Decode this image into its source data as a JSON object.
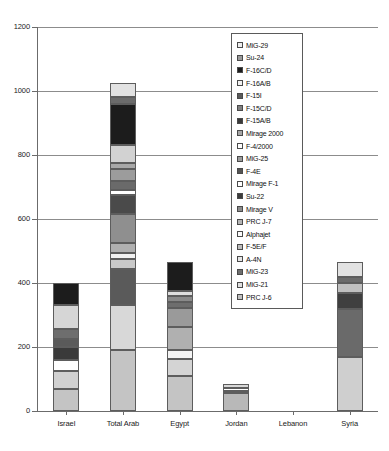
{
  "chart_data": {
    "type": "bar",
    "stacked": true,
    "title": "",
    "xlabel": "",
    "ylabel": "",
    "ylim": [
      0,
      1200
    ],
    "ytick_labels": [
      "0",
      "200",
      "400",
      "600",
      "800",
      "1000",
      "1200"
    ],
    "ytick_values": [
      0,
      200,
      400,
      600,
      800,
      1000,
      1200
    ],
    "grid": true,
    "legend_position": "inside-upper-right",
    "categories": [
      "Israel",
      "Total Arab",
      "Egypt",
      "Jordan",
      "Lebanon",
      "Syria"
    ],
    "totals": [
      400,
      1025,
      465,
      85,
      0,
      465
    ],
    "series": [
      {
        "name": "MiG-29",
        "color": "#e8e8e8",
        "values": [
          0,
          45,
          0,
          0,
          0,
          45
        ]
      },
      {
        "name": "Su-24",
        "color": "#6b6b6b",
        "values": [
          0,
          20,
          0,
          0,
          0,
          20
        ]
      },
      {
        "name": "F-16C/D",
        "color": "#1c1c1c",
        "values": [
          50,
          50,
          0,
          0,
          0,
          0
        ]
      },
      {
        "name": "F-16A/B",
        "color": "#d9d9d9",
        "values": [
          0,
          0,
          0,
          0,
          0,
          0
        ]
      },
      {
        "name": "F-15I",
        "color": "#4f4f4f",
        "values": [
          0,
          0,
          0,
          0,
          0,
          0
        ]
      },
      {
        "name": "F-15C/D",
        "color": "#6e6e6e",
        "values": [
          0,
          0,
          0,
          0,
          0,
          0
        ]
      },
      {
        "name": "F-15A/B",
        "color": "#3c3c3c",
        "values": [
          0,
          0,
          0,
          0,
          0,
          0
        ]
      },
      {
        "name": "Mirage 2000",
        "color": "#a8a8a8",
        "values": [
          0,
          110,
          0,
          0,
          0,
          0
        ]
      },
      {
        "name": "F-4/2000",
        "color": "#fbfbfb",
        "values": [
          0,
          0,
          0,
          0,
          0,
          0
        ]
      },
      {
        "name": "MiG-25",
        "color": "#9c9c9c",
        "values": [
          0,
          35,
          0,
          0,
          0,
          35
        ]
      },
      {
        "name": "F-4E",
        "color": "#575757",
        "values": [
          0,
          0,
          0,
          0,
          0,
          0
        ]
      },
      {
        "name": "Mirage F-1",
        "color": "#ffffff",
        "values": [
          0,
          15,
          0,
          0,
          0,
          0
        ]
      },
      {
        "name": "Su-22",
        "color": "#4a4a4a",
        "values": [
          0,
          60,
          0,
          0,
          0,
          60
        ]
      },
      {
        "name": "Mirage V",
        "color": "#8f8f8f",
        "values": [
          0,
          45,
          0,
          0,
          0,
          0
        ]
      },
      {
        "name": "PRC J-7",
        "color": "#b5b5b5",
        "values": [
          0,
          80,
          0,
          0,
          0,
          0
        ]
      },
      {
        "name": "Alphajet",
        "color": "#f7f7f7",
        "values": [
          0,
          35,
          30,
          0,
          0,
          0
        ]
      },
      {
        "name": "F-5E/F",
        "color": "#c9c9c9",
        "values": [
          0,
          30,
          0,
          0,
          0,
          0
        ]
      },
      {
        "name": "A-4N",
        "color": "#dcdcdc",
        "values": [
          90,
          0,
          0,
          0,
          0,
          0
        ]
      },
      {
        "name": "MiG-23",
        "color": "#5a5a5a",
        "values": [
          0,
          130,
          95,
          0,
          0,
          135
        ]
      },
      {
        "name": "MiG-21",
        "color": "#e0e0e0",
        "values": [
          0,
          0,
          0,
          0,
          0,
          0
        ]
      },
      {
        "name": "PRC J-6",
        "color": "#bdbdbd",
        "values": [
          260,
          370,
          340,
          85,
          0,
          170
        ]
      }
    ],
    "bars": [
      {
        "category": "Israel",
        "total": 400,
        "segments": [
          {
            "label": "F-16C/D",
            "value": 70,
            "color": "#1c1c1c"
          },
          {
            "label": "F-16A/B",
            "value": 75,
            "color": "#d6d6d6"
          },
          {
            "label": "F-15C/D",
            "value": 30,
            "color": "#6e6e6e"
          },
          {
            "label": "F-15A/B",
            "value": 25,
            "color": "#5a5a5a"
          },
          {
            "label": "F-4E",
            "value": 40,
            "color": "#3a3a3a"
          },
          {
            "label": "Mirage F-1",
            "value": 35,
            "color": "#ffffff"
          },
          {
            "label": "A-4N",
            "value": 55,
            "color": "#d0d0d0"
          },
          {
            "label": "PRC J-6",
            "value": 70,
            "color": "#c4c4c4"
          }
        ]
      },
      {
        "category": "Total Arab",
        "total": 1025,
        "segments": [
          {
            "label": "MiG-29",
            "value": 45,
            "color": "#e2e2e2"
          },
          {
            "label": "Su-24",
            "value": 20,
            "color": "#6b6b6b"
          },
          {
            "label": "F-16C/D",
            "value": 130,
            "color": "#1c1c1c"
          },
          {
            "label": "Mirage 2000",
            "value": 55,
            "color": "#d2d2d2"
          },
          {
            "label": "F-4/2000",
            "value": 20,
            "color": "#a8a8a8"
          },
          {
            "label": "MiG-25",
            "value": 35,
            "color": "#9c9c9c"
          },
          {
            "label": "F-4E",
            "value": 30,
            "color": "#6a6a6a"
          },
          {
            "label": "Mirage F-1",
            "value": 15,
            "color": "#ffffff"
          },
          {
            "label": "Su-22",
            "value": 60,
            "color": "#4a4a4a"
          },
          {
            "label": "Mirage V",
            "value": 90,
            "color": "#8f8f8f"
          },
          {
            "label": "PRC J-7",
            "value": 30,
            "color": "#b0b0b0"
          },
          {
            "label": "Alphajet",
            "value": 20,
            "color": "#f2f2f2"
          },
          {
            "label": "F-5E/F",
            "value": 30,
            "color": "#c9c9c9"
          },
          {
            "label": "MiG-23",
            "value": 115,
            "color": "#5a5a5a"
          },
          {
            "label": "MiG-21",
            "value": 140,
            "color": "#d8d8d8"
          },
          {
            "label": "PRC J-6",
            "value": 190,
            "color": "#c4c4c4"
          }
        ]
      },
      {
        "category": "Egypt",
        "total": 465,
        "segments": [
          {
            "label": "F-16C/D",
            "value": 90,
            "color": "#1c1c1c"
          },
          {
            "label": "F-16A/B",
            "value": 15,
            "color": "#dedede"
          },
          {
            "label": "Mirage 2000",
            "value": 20,
            "color": "#8a8a8a"
          },
          {
            "label": "F-4E",
            "value": 18,
            "color": "#6e6e6e"
          },
          {
            "label": "Mirage V",
            "value": 60,
            "color": "#9a9a9a"
          },
          {
            "label": "PRC J-7",
            "value": 70,
            "color": "#b0b0b0"
          },
          {
            "label": "Alphajet",
            "value": 30,
            "color": "#f4f4f4"
          },
          {
            "label": "MiG-21",
            "value": 52,
            "color": "#d4d4d4"
          },
          {
            "label": "PRC J-6",
            "value": 110,
            "color": "#c4c4c4"
          }
        ]
      },
      {
        "category": "Jordan",
        "total": 85,
        "segments": [
          {
            "label": "Mirage F-1",
            "value": 12,
            "color": "#d8d8d8"
          },
          {
            "label": "F-5E/F",
            "value": 10,
            "color": "#ffffff"
          },
          {
            "label": "A-4N",
            "value": 8,
            "color": "#e4e4e4"
          },
          {
            "label": "PRC J-6",
            "value": 55,
            "color": "#b8b8b8"
          }
        ]
      },
      {
        "category": "Lebanon",
        "total": 0,
        "segments": []
      },
      {
        "category": "Syria",
        "total": 465,
        "segments": [
          {
            "label": "MiG-29",
            "value": 45,
            "color": "#e2e2e2"
          },
          {
            "label": "Su-24",
            "value": 20,
            "color": "#6b6b6b"
          },
          {
            "label": "MiG-25",
            "value": 30,
            "color": "#c0c0c0"
          },
          {
            "label": "Su-22",
            "value": 50,
            "color": "#3f3f3f"
          },
          {
            "label": "MiG-23",
            "value": 150,
            "color": "#6a6a6a"
          },
          {
            "label": "MiG-21",
            "value": 170,
            "color": "#cfcfcf"
          }
        ]
      }
    ],
    "legend_entries": [
      {
        "label": "MiG-29",
        "color": "#eeeeee"
      },
      {
        "label": "Su-24",
        "color": "#9a9a9a"
      },
      {
        "label": "F-16C/D",
        "color": "#1c1c1c"
      },
      {
        "label": "F-16A/B",
        "color": "#f2f2f2"
      },
      {
        "label": "F-15I",
        "color": "#5a5a5a"
      },
      {
        "label": "F-15C/D",
        "color": "#808080"
      },
      {
        "label": "F-15A/B",
        "color": "#3a3a3a"
      },
      {
        "label": "Mirage 2000",
        "color": "#a6a6a6"
      },
      {
        "label": "F-4/2000",
        "color": "#fdfdfd"
      },
      {
        "label": "MiG-25",
        "color": "#9c9c9c"
      },
      {
        "label": "F-4E",
        "color": "#545454"
      },
      {
        "label": "Mirage F-1",
        "color": "#ffffff"
      },
      {
        "label": "Su-22",
        "color": "#3c3c3c"
      },
      {
        "label": "Mirage V",
        "color": "#8c8c8c"
      },
      {
        "label": "PRC J-7",
        "color": "#b4b4b4"
      },
      {
        "label": "Alphajet",
        "color": "#fbfbfb"
      },
      {
        "label": "F-5E/F",
        "color": "#bdbdbd"
      },
      {
        "label": "A-4N",
        "color": "#e6e6e6"
      },
      {
        "label": "MiG-23",
        "color": "#6e6e6e"
      },
      {
        "label": "MiG-21",
        "color": "#e0e0e0"
      },
      {
        "label": "PRC J-6",
        "color": "#c0c0c0"
      }
    ]
  }
}
